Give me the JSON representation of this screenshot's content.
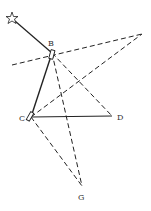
{
  "diagram": {
    "stroke_color": "#222222",
    "points": {
      "star": {
        "x": 12,
        "y": 18
      },
      "B": {
        "x": 52,
        "y": 53,
        "label": "B",
        "lx": 48,
        "ly": 46
      },
      "T": {
        "x": 142,
        "y": 34
      },
      "L": {
        "x": 12,
        "y": 65
      },
      "C": {
        "x": 31,
        "y": 117,
        "label": "C",
        "lx": 20,
        "ly": 121
      },
      "D": {
        "x": 112,
        "y": 116,
        "label": "D",
        "lx": 117,
        "ly": 120
      },
      "G": {
        "x": 82,
        "y": 186,
        "label": "G",
        "lx": 78,
        "ly": 200
      }
    },
    "labels": {
      "B": "B",
      "C": "C",
      "D": "D",
      "G": "G"
    }
  }
}
